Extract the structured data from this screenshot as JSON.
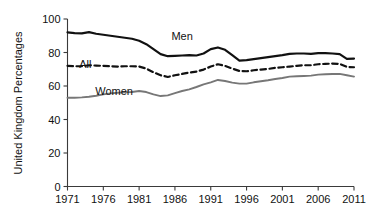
{
  "chart_data": {
    "type": "line",
    "title": "",
    "subtitle": "",
    "xlabel": "",
    "ylabel": "United Kingdom Percentages",
    "xlim": [
      1971,
      2011
    ],
    "ylim": [
      0,
      100
    ],
    "grid": false,
    "legend": "inline-annotations",
    "x_ticks": [
      "1971",
      "1976",
      "1981",
      "1986",
      "1991",
      "1996",
      "2001",
      "2006",
      "2011"
    ],
    "x_tick_values": [
      1971,
      1976,
      1981,
      1986,
      1991,
      1996,
      2001,
      2006,
      2011
    ],
    "y_ticks": [
      "0",
      "20",
      "40",
      "60",
      "80",
      "100"
    ],
    "y_tick_values": [
      0,
      20,
      40,
      60,
      80,
      100
    ],
    "x": [
      1971,
      1972,
      1973,
      1974,
      1975,
      1976,
      1977,
      1978,
      1979,
      1980,
      1981,
      1982,
      1983,
      1984,
      1985,
      1986,
      1987,
      1988,
      1989,
      1990,
      1991,
      1992,
      1993,
      1994,
      1995,
      1996,
      1997,
      1998,
      1999,
      2000,
      2001,
      2002,
      2003,
      2004,
      2005,
      2006,
      2007,
      2008,
      2009,
      2010,
      2011
    ],
    "series": [
      {
        "name": "Men",
        "label": "Men",
        "color": "#111111",
        "style": "solid",
        "width": 2.2,
        "values": [
          92.0,
          91.6,
          91.4,
          92.2,
          91.2,
          90.6,
          90.0,
          89.4,
          88.8,
          88.2,
          87.0,
          85.0,
          82.0,
          79.0,
          77.8,
          78.0,
          78.2,
          78.4,
          78.2,
          79.4,
          82.0,
          83.0,
          81.6,
          78.4,
          75.2,
          75.4,
          76.0,
          76.6,
          77.2,
          77.8,
          78.4,
          79.2,
          79.4,
          79.4,
          79.2,
          79.6,
          79.6,
          79.4,
          79.0,
          76.2,
          76.4
        ]
      },
      {
        "name": "All",
        "label": "All",
        "color": "#111111",
        "style": "dashed",
        "width": 2.2,
        "values": [
          72.0,
          71.8,
          71.8,
          72.4,
          72.2,
          72.0,
          71.8,
          71.6,
          71.8,
          71.8,
          71.6,
          70.4,
          68.2,
          66.4,
          65.4,
          66.4,
          67.2,
          68.0,
          68.6,
          69.8,
          71.6,
          73.0,
          72.0,
          70.4,
          69.0,
          68.8,
          69.4,
          69.8,
          70.2,
          70.8,
          71.2,
          71.6,
          72.0,
          72.4,
          72.4,
          73.0,
          73.2,
          73.4,
          73.2,
          71.4,
          71.2
        ]
      },
      {
        "name": "Women",
        "label": "Women",
        "color": "#777777",
        "style": "solid",
        "width": 1.9,
        "values": [
          53.0,
          53.0,
          53.2,
          53.6,
          54.2,
          55.0,
          55.6,
          56.0,
          56.2,
          56.4,
          57.0,
          56.4,
          55.0,
          54.0,
          54.4,
          55.8,
          57.0,
          58.0,
          59.4,
          61.0,
          62.2,
          63.6,
          63.0,
          62.0,
          61.4,
          61.4,
          62.2,
          62.8,
          63.4,
          64.2,
          64.8,
          65.6,
          65.8,
          66.0,
          66.2,
          66.8,
          67.0,
          67.2,
          67.2,
          66.4,
          65.6
        ]
      }
    ],
    "annotations": [
      {
        "text": "Men",
        "x": 1987.0,
        "y": 87.5
      },
      {
        "text": "All",
        "x": 1973.5,
        "y": 70.5
      },
      {
        "text": "Women",
        "x": 1977.5,
        "y": 54.5
      }
    ]
  },
  "axis": {
    "y_axis_title": "United Kingdom Percentages"
  }
}
